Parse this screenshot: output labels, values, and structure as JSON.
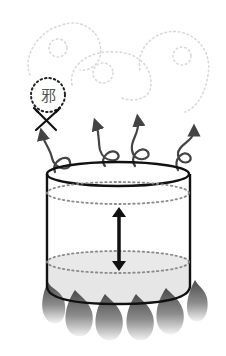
{
  "diagram": {
    "type": "illustration",
    "symbol": {
      "character": "邪",
      "enclosure": "dotted-circle",
      "crossed_out": true
    },
    "steam_spirals": 4,
    "clouds": 3,
    "flames": 6,
    "level_indicator": "double-arrow"
  },
  "colors": {
    "outline": "#111111",
    "dotted_lines": "#8a8a8a",
    "clouds": "#d8d8d8",
    "liquid": "#e4e4e4",
    "flame_top": "#555555",
    "flame_bottom": "#f2f2f2",
    "steam": "#444444"
  }
}
